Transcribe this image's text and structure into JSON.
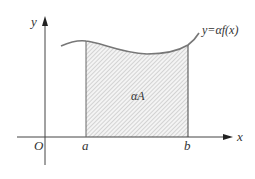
{
  "diagram": {
    "type": "area-under-curve",
    "axes": {
      "x_label": "x",
      "y_label": "y",
      "origin_label": "O"
    },
    "curve": {
      "label": "y=αf(x)"
    },
    "bounds": {
      "a_label": "a",
      "b_label": "b"
    },
    "region": {
      "label": "αA",
      "fill": "hatched"
    },
    "colors": {
      "axis": "#444444",
      "curve": "#777777",
      "bound_lines": "#555555",
      "hatch": "#bdbdbd",
      "text": "#333333"
    }
  }
}
